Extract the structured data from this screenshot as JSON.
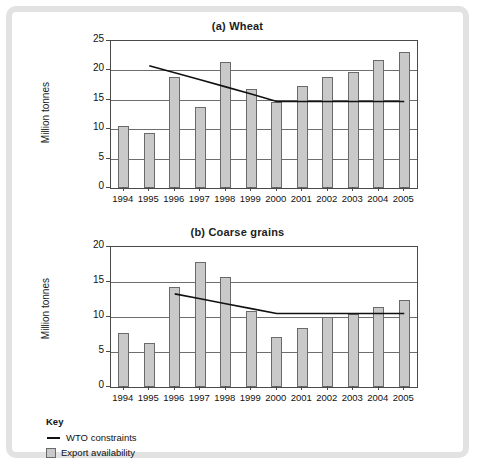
{
  "figure": {
    "frame_color": "#e2e2e2",
    "bar_fill": "#c9c9c9",
    "bar_stroke": "#6a6a6a",
    "line_color": "#111111"
  },
  "key": {
    "title": "Key",
    "items": [
      {
        "label": "WTO constraints",
        "type": "line"
      },
      {
        "label": "Export availability",
        "type": "bar"
      }
    ]
  },
  "chart_data": [
    {
      "type": "bar",
      "title": "(a) Wheat",
      "xlabel": "",
      "ylabel": "Million tonnes",
      "categories": [
        "1994",
        "1995",
        "1996",
        "1997",
        "1998",
        "1999",
        "2000",
        "2001",
        "2002",
        "2003",
        "2004",
        "2005"
      ],
      "ylim": [
        0,
        25
      ],
      "yticks": [
        0,
        5,
        10,
        15,
        20,
        25
      ],
      "grid": true,
      "legend_position": "below-figure",
      "series": [
        {
          "name": "Export availability",
          "type": "bar",
          "values": [
            10.6,
            9.3,
            18.9,
            13.8,
            21.5,
            16.8,
            14.7,
            17.3,
            18.8,
            19.8,
            21.7,
            23.2
          ]
        },
        {
          "name": "WTO constraints",
          "type": "line",
          "x": [
            "1995",
            "1996",
            "1997",
            "1998",
            "1999",
            "2000",
            "2001",
            "2002",
            "2003",
            "2004",
            "2005"
          ],
          "values": [
            20.8,
            19.6,
            18.4,
            17.2,
            16.0,
            14.7,
            14.7,
            14.7,
            14.7,
            14.7,
            14.7
          ]
        }
      ]
    },
    {
      "type": "bar",
      "title": "(b) Coarse grains",
      "xlabel": "",
      "ylabel": "Million tonnes",
      "categories": [
        "1994",
        "1995",
        "1996",
        "1997",
        "1998",
        "1999",
        "2000",
        "2001",
        "2002",
        "2003",
        "2004",
        "2005"
      ],
      "ylim": [
        0,
        20
      ],
      "yticks": [
        0,
        5,
        10,
        15,
        20
      ],
      "grid": true,
      "legend_position": "below-figure",
      "series": [
        {
          "name": "Export availability",
          "type": "bar",
          "values": [
            7.7,
            6.3,
            14.3,
            17.9,
            15.7,
            10.8,
            7.2,
            8.5,
            10.0,
            10.4,
            11.5,
            12.4
          ]
        },
        {
          "name": "WTO constraints",
          "type": "line",
          "x": [
            "1996",
            "1997",
            "1998",
            "1999",
            "2000",
            "2001",
            "2002",
            "2003",
            "2004",
            "2005"
          ],
          "values": [
            13.3,
            12.6,
            11.9,
            11.2,
            10.5,
            10.5,
            10.5,
            10.5,
            10.5,
            10.5
          ]
        }
      ]
    }
  ]
}
